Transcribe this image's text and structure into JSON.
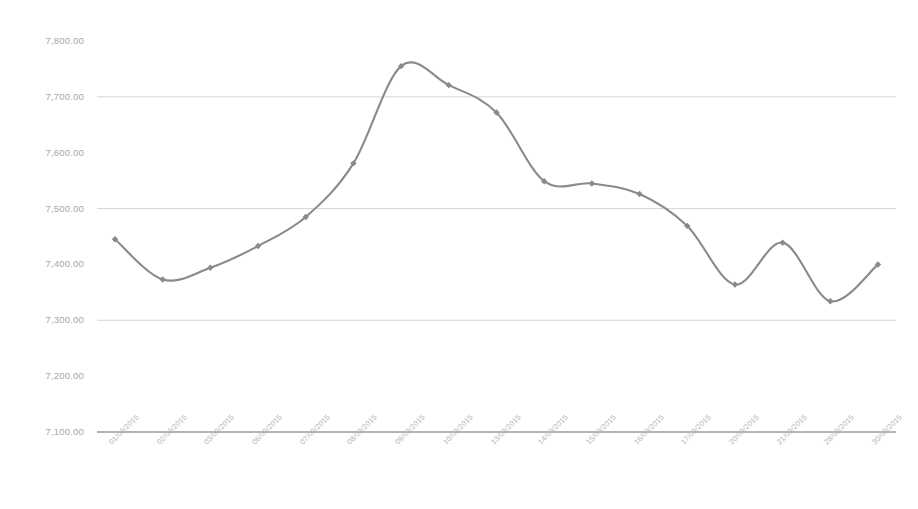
{
  "chart_data": {
    "type": "line",
    "title": "",
    "xlabel": "",
    "ylabel": "",
    "grid": true,
    "legend": "none",
    "ylim": [
      7100,
      7800
    ],
    "ytick_step": 100,
    "ytick_labels": [
      "7,800.00",
      "7,700.00",
      "7,600.00",
      "7,500.00",
      "7,400.00",
      "7,300.00",
      "7,200.00",
      "7,100.00"
    ],
    "ytick_values": [
      7800,
      7700,
      7600,
      7500,
      7400,
      7300,
      7200,
      7100
    ],
    "categories": [
      "01/09/2015",
      "02/09/2015",
      "03/09/2015",
      "06/09/2015",
      "07/09/2015",
      "08/09/2015",
      "09/09/2015",
      "10/09/2015",
      "13/09/2015",
      "14/09/2015",
      "15/09/2015",
      "16/09/2015",
      "17/09/2015",
      "20/09/2015",
      "21/09/2015",
      "28/09/2015",
      "30/09/2015"
    ],
    "values": [
      7445.0,
      7373.0,
      7394.0,
      7433.0,
      7485.0,
      7581.0,
      7755.0,
      7721.0,
      7672.0,
      7549.0,
      7545.0,
      7526.0,
      7469.0,
      7364.0,
      7439.0,
      7334.0,
      7400.0
    ],
    "series_color": "#8a8a8a",
    "gridline_color": "#d6d6d6",
    "axis_color": "#9a9a9a",
    "marker": "diamond",
    "smoothing": true
  }
}
